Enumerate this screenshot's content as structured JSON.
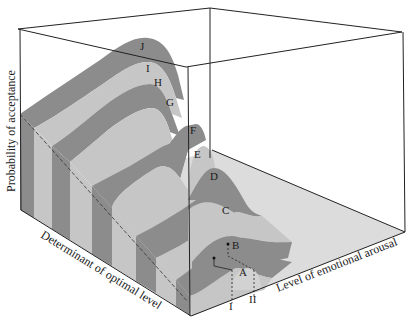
{
  "figure": {
    "type": "3d-surface-diagram",
    "axes": {
      "vertical": "Probability of acceptance",
      "depth": "Determinant of optimal level",
      "horizontal": "Level of emotional arousal"
    },
    "curves": [
      {
        "id": "J",
        "label": "J"
      },
      {
        "id": "I",
        "label": "I"
      },
      {
        "id": "H",
        "label": "H"
      },
      {
        "id": "G",
        "label": "G"
      },
      {
        "id": "F",
        "label": "F"
      },
      {
        "id": "E",
        "label": "E"
      },
      {
        "id": "D",
        "label": "D"
      },
      {
        "id": "C",
        "label": "C"
      },
      {
        "id": "B",
        "label": "B"
      },
      {
        "id": "A",
        "label": "A"
      }
    ],
    "markers": [
      {
        "id": "I",
        "label": "I"
      },
      {
        "id": "II",
        "label": "II"
      }
    ],
    "colors": {
      "dark_band": "#8c8c8c",
      "light_band": "#c6c6c6",
      "floor": "#dadada",
      "edge": "#222222"
    }
  }
}
